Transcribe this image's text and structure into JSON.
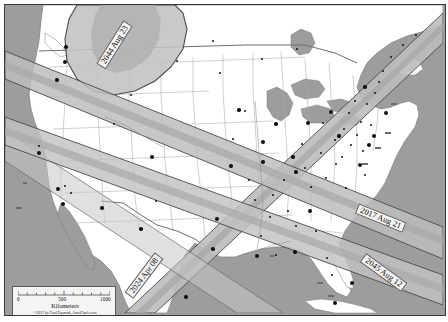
{
  "map": {
    "title": "Solar Eclipse Paths across North America",
    "colors": {
      "ocean": "#9d9d9d",
      "land": "#ffffff",
      "state_border": "#9a9a9a",
      "country_border": "#6f6f6f",
      "umbra_band": "#b8b8b8",
      "penumbra_shade": "#c9c9c9",
      "band_edge": "#4a4a4a",
      "city_dot": "#111111",
      "label_box": "#f2f2f2",
      "frame": "#3a3a3a"
    },
    "eclipse_paths": [
      {
        "name": "2044 Aug 23",
        "label": "2044 Aug 23",
        "rotation": -58,
        "x": 96,
        "y": 56
      },
      {
        "name": "2024 Apr 08",
        "label": "2024 Apr 08",
        "rotation": -53,
        "x": 124,
        "y": 285
      },
      {
        "name": "2017 Aug 21",
        "label": "2017 Aug 21",
        "rotation": 22,
        "x": 352,
        "y": 198
      },
      {
        "name": "2045 Aug 12",
        "label": "2045 Aug 12",
        "rotation": 36,
        "x": 358,
        "y": 247
      }
    ],
    "cities": [
      {
        "name": "Vancouver",
        "label": "Vancouver",
        "style": "plain",
        "dot_x": 61,
        "dot_y": 42,
        "lx": 66,
        "ly": 37
      },
      {
        "name": "Seattle",
        "label": "Seattle",
        "style": "plain",
        "dot_x": 60,
        "dot_y": 57,
        "lx": 66,
        "ly": 52
      },
      {
        "name": "Portland",
        "label": "Portland",
        "style": "plain",
        "dot_x": 52,
        "dot_y": 75,
        "lx": 58,
        "ly": 70
      },
      {
        "name": "San Francisco",
        "label": "San\nFrancisco",
        "style": "plain",
        "dot_x": 34,
        "dot_y": 148,
        "lx": 28,
        "ly": 144
      },
      {
        "name": "Los Angeles",
        "label": "Los\nAngeles",
        "style": "boxed",
        "dot_x": 53,
        "dot_y": 184,
        "lx": 18,
        "ly": 177
      },
      {
        "name": "San Diego",
        "label": "San Diego",
        "style": "boxed",
        "dot_x": 58,
        "dot_y": 199,
        "lx": 11,
        "ly": 202
      },
      {
        "name": "Phoenix",
        "label": "Phoenix",
        "style": "plain",
        "dot_x": 97,
        "dot_y": 203,
        "lx": 103,
        "ly": 198
      },
      {
        "name": "El Paso",
        "label": "El Paso",
        "style": "plain",
        "dot_x": 136,
        "dot_y": 224,
        "lx": 143,
        "ly": 221
      },
      {
        "name": "Denver",
        "label": "Denver",
        "style": "plain",
        "dot_x": 147,
        "dot_y": 152,
        "lx": 154,
        "ly": 148
      },
      {
        "name": "Minneapolis",
        "label": "Minneapolis",
        "style": "plain",
        "dot_x": 234,
        "dot_y": 105,
        "lx": 182,
        "ly": 97
      },
      {
        "name": "Milwaukee",
        "label": "Milwaukee",
        "style": "plain",
        "dot_x": 271,
        "dot_y": 119,
        "lx": 228,
        "ly": 114
      },
      {
        "name": "Chicago",
        "label": "Chicago",
        "style": "plain",
        "dot_x": 258,
        "dot_y": 137,
        "lx": 236,
        "ly": 133
      },
      {
        "name": "St. Louis",
        "label": "St.\nLouis",
        "style": "plain",
        "dot_x": 258,
        "dot_y": 157,
        "lx": 245,
        "ly": 144
      },
      {
        "name": "Kansas City",
        "label": "Kansas\nCity",
        "style": "plain",
        "dot_x": 226,
        "dot_y": 161,
        "lx": 199,
        "ly": 160
      },
      {
        "name": "Dallas",
        "label": "Dallas",
        "style": "plain",
        "dot_x": 212,
        "dot_y": 214,
        "lx": 183,
        "ly": 211
      },
      {
        "name": "Austin",
        "label": "Austin",
        "style": "plain",
        "dot_x": 208,
        "dot_y": 244,
        "lx": 210,
        "ly": 238
      },
      {
        "name": "Houston",
        "label": "Houston",
        "style": "plain",
        "dot_x": 252,
        "dot_y": 251,
        "lx": 227,
        "ly": 254
      },
      {
        "name": "New Orleans",
        "label": "New\nOrleans",
        "style": "boxed",
        "dot_x": 290,
        "dot_y": 247,
        "lx": 265,
        "ly": 250
      },
      {
        "name": "Monterrey",
        "label": "Monterrey",
        "style": "plain",
        "dot_x": 181,
        "dot_y": 292,
        "lx": 186,
        "ly": 291
      },
      {
        "name": "Atlanta",
        "label": "Atlanta",
        "style": "plain",
        "dot_x": 305,
        "dot_y": 206,
        "lx": 307,
        "ly": 207
      },
      {
        "name": "Indianapolis",
        "label": "Indianapolis",
        "style": "plain",
        "dot_x": 288,
        "dot_y": 152,
        "lx": 288,
        "ly": 151
      },
      {
        "name": "Cincinnati",
        "label": "Cincinnati",
        "style": "plain",
        "dot_x": 291,
        "dot_y": 167,
        "lx": 299,
        "ly": 163
      },
      {
        "name": "Detroit",
        "label": "Detroit",
        "style": "plain",
        "dot_x": 303,
        "dot_y": 118,
        "lx": 282,
        "ly": 116
      },
      {
        "name": "Cleveland",
        "label": "Cleveland",
        "style": "plain",
        "dot_x": 334,
        "dot_y": 131,
        "lx": 320,
        "ly": 128
      },
      {
        "name": "Toronto",
        "label": "Toronto",
        "style": "plain",
        "dot_x": 326,
        "dot_y": 107,
        "lx": 302,
        "ly": 101
      },
      {
        "name": "Montreal",
        "label": "Montréal",
        "style": "plain",
        "dot_x": 360,
        "dot_y": 82,
        "lx": 324,
        "ly": 72
      },
      {
        "name": "Boston",
        "label": "Boston",
        "style": "boxed",
        "dot_x": 381,
        "dot_y": 108,
        "lx": 386,
        "ly": 98
      },
      {
        "name": "New York",
        "label": "New York",
        "style": "boxed",
        "dot_x": 369,
        "dot_y": 131,
        "lx": 380,
        "ly": 127
      },
      {
        "name": "Philadelphia",
        "label": "Philadelphia",
        "style": "boxed",
        "dot_x": 364,
        "dot_y": 140,
        "lx": 370,
        "ly": 142
      },
      {
        "name": "Washington DC",
        "label": "Washington DC",
        "style": "boxed",
        "dot_x": 355,
        "dot_y": 160,
        "lx": 357,
        "ly": 158
      },
      {
        "name": "Miami",
        "label": "Miami",
        "style": "boxed",
        "dot_x": 347,
        "dot_y": 278,
        "lx": 312,
        "ly": 277
      },
      {
        "name": "Havana",
        "label": "Havana",
        "style": "boxed",
        "dot_x": 330,
        "dot_y": 298,
        "lx": 323,
        "ly": 290
      }
    ],
    "unlabeled_dots": [
      {
        "x": 34,
        "y": 141
      },
      {
        "x": 60,
        "y": 181
      },
      {
        "x": 66,
        "y": 188
      },
      {
        "x": 109,
        "y": 119
      },
      {
        "x": 126,
        "y": 90
      },
      {
        "x": 151,
        "y": 196
      },
      {
        "x": 172,
        "y": 56
      },
      {
        "x": 208,
        "y": 36
      },
      {
        "x": 215,
        "y": 68
      },
      {
        "x": 228,
        "y": 134
      },
      {
        "x": 240,
        "y": 106
      },
      {
        "x": 244,
        "y": 175
      },
      {
        "x": 250,
        "y": 195
      },
      {
        "x": 256,
        "y": 231
      },
      {
        "x": 265,
        "y": 212
      },
      {
        "x": 268,
        "y": 190
      },
      {
        "x": 271,
        "y": 250
      },
      {
        "x": 279,
        "y": 175
      },
      {
        "x": 283,
        "y": 206
      },
      {
        "x": 291,
        "y": 221
      },
      {
        "x": 297,
        "y": 139
      },
      {
        "x": 300,
        "y": 163
      },
      {
        "x": 306,
        "y": 182
      },
      {
        "x": 311,
        "y": 226
      },
      {
        "x": 316,
        "y": 148
      },
      {
        "x": 318,
        "y": 118
      },
      {
        "x": 321,
        "y": 173
      },
      {
        "x": 322,
        "y": 253
      },
      {
        "x": 327,
        "y": 270
      },
      {
        "x": 330,
        "y": 135
      },
      {
        "x": 331,
        "y": 159
      },
      {
        "x": 337,
        "y": 152
      },
      {
        "x": 339,
        "y": 124
      },
      {
        "x": 341,
        "y": 183
      },
      {
        "x": 344,
        "y": 108
      },
      {
        "x": 346,
        "y": 140
      },
      {
        "x": 350,
        "y": 96
      },
      {
        "x": 352,
        "y": 130
      },
      {
        "x": 356,
        "y": 117
      },
      {
        "x": 358,
        "y": 146
      },
      {
        "x": 360,
        "y": 170
      },
      {
        "x": 362,
        "y": 99
      },
      {
        "x": 366,
        "y": 120
      },
      {
        "x": 370,
        "y": 88
      },
      {
        "x": 374,
        "y": 77
      },
      {
        "x": 378,
        "y": 66
      },
      {
        "x": 386,
        "y": 52
      },
      {
        "x": 398,
        "y": 40
      },
      {
        "x": 411,
        "y": 30
      },
      {
        "x": 257,
        "y": 54
      },
      {
        "x": 292,
        "y": 44
      }
    ],
    "scale_bar": {
      "unit_label": "Kilometers",
      "ticks": [
        "0",
        "500",
        "1000"
      ],
      "credit": "©2013 by Fred Espenak, AstroPixels.com"
    }
  }
}
